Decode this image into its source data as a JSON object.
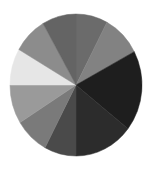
{
  "chart_data": {
    "type": "pie",
    "title": "",
    "legend": [],
    "labels_visible": false,
    "layout": {
      "center_x": 76,
      "center_y": 85,
      "radius_x": 66,
      "radius_y": 71,
      "start_angle_deg_clockwise_from_top": 0
    },
    "slices": [
      {
        "index": 1,
        "start_deg": 0,
        "end_deg": 28,
        "percent": 7.8,
        "color": "#6b6b6b"
      },
      {
        "index": 2,
        "start_deg": 28,
        "end_deg": 62,
        "percent": 9.4,
        "color": "#828282"
      },
      {
        "index": 3,
        "start_deg": 62,
        "end_deg": 128,
        "percent": 18.3,
        "color": "#1e1e1e"
      },
      {
        "index": 4,
        "start_deg": 128,
        "end_deg": 180,
        "percent": 14.4,
        "color": "#2c2c2c"
      },
      {
        "index": 5,
        "start_deg": 180,
        "end_deg": 208,
        "percent": 7.8,
        "color": "#4a4a4a"
      },
      {
        "index": 6,
        "start_deg": 208,
        "end_deg": 238,
        "percent": 8.3,
        "color": "#7a7a7a"
      },
      {
        "index": 7,
        "start_deg": 238,
        "end_deg": 270,
        "percent": 8.9,
        "color": "#9a9a9a"
      },
      {
        "index": 8,
        "start_deg": 270,
        "end_deg": 300,
        "percent": 8.3,
        "color": "#e6e6e6"
      },
      {
        "index": 9,
        "start_deg": 300,
        "end_deg": 330,
        "percent": 8.3,
        "color": "#8c8c8c"
      },
      {
        "index": 10,
        "start_deg": 330,
        "end_deg": 360,
        "percent": 8.3,
        "color": "#646464"
      }
    ]
  }
}
